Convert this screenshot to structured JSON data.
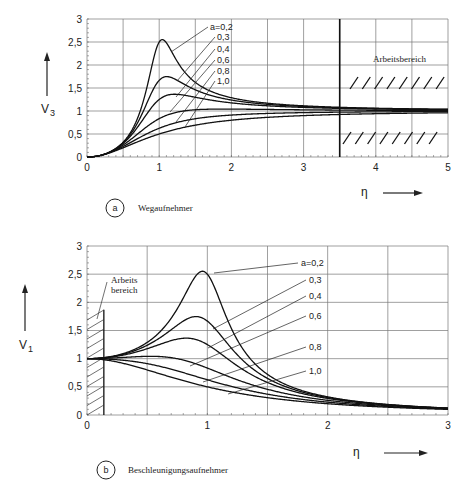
{
  "chart_data": [
    {
      "type": "line",
      "panel": "a",
      "title": "Wegaufnehmer",
      "xlabel": "η",
      "ylabel": "V3",
      "xlim": [
        0,
        5
      ],
      "ylim": [
        0,
        3
      ],
      "x_ticks": [
        "0",
        "1",
        "2",
        "3",
        "4",
        "5"
      ],
      "y_ticks": [
        "0",
        "0,5",
        "1",
        "1,5",
        "2",
        "2,5",
        "3"
      ],
      "grid": true,
      "formula": "V3 = η² / sqrt((1-η²)² + (2aη)²)",
      "series": [
        {
          "name": "a=0,2",
          "damping": 0.2,
          "peak": [
            1.02,
            2.55
          ]
        },
        {
          "name": "0,3",
          "damping": 0.3,
          "peak": [
            1.1,
            1.75
          ]
        },
        {
          "name": "0,4",
          "damping": 0.4,
          "peak": [
            1.2,
            1.36
          ]
        },
        {
          "name": "0,6",
          "damping": 0.6,
          "peak": [
            2.0,
            1.04
          ]
        },
        {
          "name": "0,8",
          "damping": 0.8,
          "peak": [
            3.0,
            0.98
          ]
        },
        {
          "name": "1,0",
          "damping": 1.0,
          "peak": [
            5.0,
            0.96
          ]
        }
      ],
      "annotations": [
        {
          "text": "Arbeitsbereich",
          "x_from": 3.5,
          "x_to": 5,
          "band": [
            0.5,
            1.5
          ]
        }
      ]
    },
    {
      "type": "line",
      "panel": "b",
      "title": "Beschleunigungsaufnehmer",
      "xlabel": "η",
      "ylabel": "V1",
      "xlim": [
        0,
        3
      ],
      "ylim": [
        0,
        3
      ],
      "x_ticks": [
        "0",
        "1",
        "2",
        "3"
      ],
      "y_ticks": [
        "0",
        "0,5",
        "1",
        "1,5",
        "2",
        "2,5",
        "3"
      ],
      "grid": true,
      "formula": "V1 = 1 / sqrt((1-η²)² + (2aη)²)",
      "series": [
        {
          "name": "a=0,2",
          "damping": 0.2,
          "peak": [
            0.96,
            2.55
          ]
        },
        {
          "name": "0,3",
          "damping": 0.3,
          "peak": [
            0.9,
            1.75
          ]
        },
        {
          "name": "0,4",
          "damping": 0.4,
          "peak": [
            0.82,
            1.36
          ]
        },
        {
          "name": "0,6",
          "damping": 0.6,
          "peak": [
            0.53,
            1.04
          ]
        },
        {
          "name": "0,8",
          "damping": 0.8,
          "peak": [
            0,
            1.0
          ]
        },
        {
          "name": "1,0",
          "damping": 1.0,
          "peak": [
            0,
            1.0
          ]
        }
      ],
      "annotations": [
        {
          "text": "Arbeits bereich",
          "x_from": 0,
          "x_to": 0.14
        }
      ]
    }
  ],
  "panel_a": {
    "badge": "a",
    "caption": "Wegaufnehmer",
    "ylabel_main": "V",
    "ylabel_sub": "3",
    "xlabel": "η",
    "workrange_label": "Arbeitsbereich",
    "legend": [
      "a=0,2",
      "0,3",
      "0,4",
      "0,6",
      "0,8",
      "1,0"
    ],
    "x_ticks": [
      "0",
      "1",
      "2",
      "3",
      "4",
      "5"
    ],
    "y_ticks": [
      "0",
      "0,5",
      "1",
      "1,5",
      "2",
      "2,5",
      "3"
    ]
  },
  "panel_b": {
    "badge": "b",
    "caption": "Beschleunigungsaufnehmer",
    "ylabel_main": "V",
    "ylabel_sub": "1",
    "xlabel": "η",
    "workrange_label_1": "Arbeits",
    "workrange_label_2": "bereich",
    "legend": [
      "a=0,2",
      "0,3",
      "0,4",
      "0,6",
      "0,8",
      "1,0"
    ],
    "x_ticks": [
      "0",
      "1",
      "2",
      "3"
    ],
    "y_ticks": [
      "0",
      "0,5",
      "1",
      "1,5",
      "2",
      "2,5",
      "3"
    ]
  }
}
